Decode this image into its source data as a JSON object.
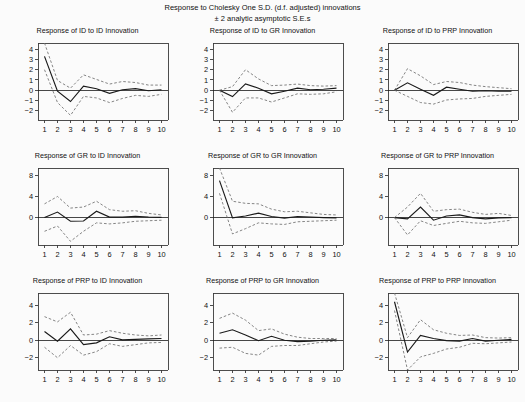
{
  "figure": {
    "title": "Response to Cholesky One S.D. (d.f. adjusted) innovations\n± 2 analytic asymptotic S.E.s",
    "title_line1": "Response to Cholesky One S.D. (d.f. adjusted) innovations",
    "title_line2": "± 2 analytic asymptotic S.E.s",
    "background_color": "#fbfbfb",
    "line_color": "#1a1a1a",
    "band_color": "#6f6f6f",
    "axis_color": "#3a3a3a",
    "rows": 3,
    "columns": 3
  },
  "chart_data": [
    {
      "type": "line",
      "title": "Response of ID to ID Innovation",
      "xlabel": "",
      "ylabel": "",
      "x": [
        1,
        2,
        3,
        4,
        5,
        6,
        7,
        8,
        9,
        10
      ],
      "xlim": [
        0.5,
        10.5
      ],
      "ylim": [
        -2.9,
        4.6
      ],
      "yticks": [
        -2,
        -1,
        0,
        1,
        2,
        3,
        4
      ],
      "xticks": [
        1,
        2,
        3,
        4,
        5,
        6,
        7,
        8,
        9,
        10
      ],
      "grid": false,
      "legend": "none",
      "zero_line": true,
      "series": [
        {
          "name": "response",
          "style": "solid",
          "values": [
            3.3,
            -0.1,
            -1.1,
            0.4,
            0.15,
            -0.3,
            0.05,
            0.15,
            -0.05,
            0.05
          ]
        },
        {
          "name": "upper_2se",
          "style": "dashed",
          "values": [
            4.6,
            0.95,
            0.2,
            1.5,
            1.05,
            0.6,
            0.85,
            0.75,
            0.5,
            0.5
          ]
        },
        {
          "name": "lower_2se",
          "style": "dashed",
          "values": [
            2.0,
            -1.2,
            -2.45,
            -0.6,
            -0.75,
            -1.2,
            -0.8,
            -0.5,
            -0.6,
            -0.4
          ]
        }
      ]
    },
    {
      "type": "line",
      "title": "Response of ID to GR Innovation",
      "xlabel": "",
      "ylabel": "",
      "x": [
        1,
        2,
        3,
        4,
        5,
        6,
        7,
        8,
        9,
        10
      ],
      "xlim": [
        0.5,
        10.5
      ],
      "ylim": [
        -2.9,
        4.6
      ],
      "yticks": [
        -2,
        -1,
        0,
        1,
        2,
        3,
        4
      ],
      "xticks": [
        1,
        2,
        3,
        4,
        5,
        6,
        7,
        8,
        9,
        10
      ],
      "grid": false,
      "legend": "none",
      "zero_line": true,
      "series": [
        {
          "name": "response",
          "style": "solid",
          "values": [
            0.0,
            -0.62,
            0.62,
            0.2,
            -0.35,
            -0.1,
            0.2,
            0.05,
            0.1,
            0.2
          ]
        },
        {
          "name": "upper_2se",
          "style": "dashed",
          "values": [
            0.0,
            0.35,
            2.0,
            1.1,
            0.45,
            0.5,
            0.6,
            0.45,
            0.4,
            0.45
          ]
        },
        {
          "name": "lower_2se",
          "style": "dashed",
          "values": [
            0.0,
            -2.15,
            -0.75,
            -0.75,
            -1.15,
            -0.75,
            -0.35,
            -0.4,
            -0.35,
            -0.15
          ]
        }
      ]
    },
    {
      "type": "line",
      "title": "Response of ID to PRP Innovation",
      "xlabel": "",
      "ylabel": "",
      "x": [
        1,
        2,
        3,
        4,
        5,
        6,
        7,
        8,
        9,
        10
      ],
      "xlim": [
        0.5,
        10.5
      ],
      "ylim": [
        -2.9,
        4.6
      ],
      "yticks": [
        -2,
        -1,
        0,
        1,
        2,
        3,
        4
      ],
      "xticks": [
        1,
        2,
        3,
        4,
        5,
        6,
        7,
        8,
        9,
        10
      ],
      "grid": false,
      "legend": "none",
      "zero_line": true,
      "series": [
        {
          "name": "response",
          "style": "solid",
          "values": [
            0.0,
            0.72,
            0.1,
            -0.5,
            0.3,
            0.1,
            -0.1,
            -0.05,
            -0.1,
            -0.1
          ]
        },
        {
          "name": "upper_2se",
          "style": "dashed",
          "values": [
            0.0,
            2.1,
            1.4,
            0.55,
            0.85,
            0.75,
            0.5,
            0.35,
            0.25,
            0.15
          ]
        },
        {
          "name": "lower_2se",
          "style": "dashed",
          "values": [
            0.0,
            -0.6,
            -1.2,
            -1.35,
            -0.95,
            -0.85,
            -0.8,
            -0.6,
            -0.5,
            -0.4
          ]
        }
      ]
    },
    {
      "type": "line",
      "title": "Response of GR to ID Innovation",
      "xlabel": "",
      "ylabel": "",
      "x": [
        1,
        2,
        3,
        4,
        5,
        6,
        7,
        8,
        9,
        10
      ],
      "xlim": [
        0.5,
        10.5
      ],
      "ylim": [
        -5.2,
        9.4
      ],
      "yticks": [
        0,
        4,
        8
      ],
      "xticks": [
        1,
        2,
        3,
        4,
        5,
        6,
        7,
        8,
        9,
        10
      ],
      "grid": false,
      "legend": "none",
      "zero_line": true,
      "series": [
        {
          "name": "response",
          "style": "solid",
          "values": [
            0.0,
            1.05,
            -0.7,
            -0.65,
            1.2,
            0.1,
            0.1,
            0.25,
            0.1,
            0.05
          ]
        },
        {
          "name": "upper_2se",
          "style": "dashed",
          "values": [
            2.6,
            4.0,
            1.8,
            2.0,
            3.1,
            1.5,
            1.2,
            1.3,
            0.8,
            0.5
          ]
        },
        {
          "name": "lower_2se",
          "style": "dashed",
          "values": [
            -2.6,
            -1.6,
            -4.5,
            -2.6,
            -1.0,
            -1.2,
            -1.0,
            -0.7,
            -0.6,
            -0.5
          ]
        }
      ]
    },
    {
      "type": "line",
      "title": "Response of GR to GR Innovation",
      "xlabel": "",
      "ylabel": "",
      "x": [
        1,
        2,
        3,
        4,
        5,
        6,
        7,
        8,
        9,
        10
      ],
      "xlim": [
        0.5,
        10.5
      ],
      "ylim": [
        -5.2,
        9.4
      ],
      "yticks": [
        0,
        4,
        8
      ],
      "xticks": [
        1,
        2,
        3,
        4,
        5,
        6,
        7,
        8,
        9,
        10
      ],
      "grid": false,
      "legend": "none",
      "zero_line": true,
      "series": [
        {
          "name": "response",
          "style": "solid",
          "values": [
            7.0,
            -0.05,
            0.3,
            0.85,
            0.2,
            -0.1,
            0.2,
            0.1,
            0.0,
            -0.05
          ]
        },
        {
          "name": "upper_2se",
          "style": "dashed",
          "values": [
            9.4,
            3.1,
            2.7,
            2.6,
            1.6,
            1.1,
            1.2,
            0.9,
            0.6,
            0.5
          ]
        },
        {
          "name": "lower_2se",
          "style": "dashed",
          "values": [
            4.6,
            -3.1,
            -2.1,
            -1.0,
            -1.2,
            -1.3,
            -0.8,
            -0.7,
            -0.6,
            -0.5
          ]
        }
      ]
    },
    {
      "type": "line",
      "title": "Response of GR to PRP Innovation",
      "xlabel": "",
      "ylabel": "",
      "x": [
        1,
        2,
        3,
        4,
        5,
        6,
        7,
        8,
        9,
        10
      ],
      "xlim": [
        0.5,
        10.5
      ],
      "ylim": [
        -5.2,
        9.4
      ],
      "yticks": [
        0,
        4,
        8
      ],
      "xticks": [
        1,
        2,
        3,
        4,
        5,
        6,
        7,
        8,
        9,
        10
      ],
      "grid": false,
      "legend": "none",
      "zero_line": true,
      "series": [
        {
          "name": "response",
          "style": "solid",
          "values": [
            0.0,
            -0.25,
            2.0,
            -0.5,
            0.3,
            0.5,
            0.0,
            -0.25,
            -0.05,
            0.0
          ]
        },
        {
          "name": "upper_2se",
          "style": "dashed",
          "values": [
            0.0,
            2.0,
            4.6,
            1.2,
            1.5,
            1.6,
            1.0,
            0.6,
            0.8,
            0.4
          ]
        },
        {
          "name": "lower_2se",
          "style": "dashed",
          "values": [
            0.0,
            -3.3,
            -0.6,
            -1.5,
            -1.1,
            -0.7,
            -1.0,
            -1.1,
            -0.8,
            -0.5
          ]
        }
      ]
    },
    {
      "type": "line",
      "title": "Response of PRP to ID Innovation",
      "xlabel": "",
      "ylabel": "",
      "x": [
        1,
        2,
        3,
        4,
        5,
        6,
        7,
        8,
        9,
        10
      ],
      "xlim": [
        0.5,
        10.5
      ],
      "ylim": [
        -3.4,
        5.4
      ],
      "yticks": [
        -2,
        0,
        2,
        4
      ],
      "xticks": [
        1,
        2,
        3,
        4,
        5,
        6,
        7,
        8,
        9,
        10
      ],
      "grid": false,
      "legend": "none",
      "zero_line": true,
      "series": [
        {
          "name": "response",
          "style": "solid",
          "values": [
            1.0,
            -0.1,
            1.3,
            -0.5,
            -0.3,
            0.4,
            0.05,
            0.1,
            0.15,
            0.2
          ]
        },
        {
          "name": "upper_2se",
          "style": "dashed",
          "values": [
            2.7,
            2.1,
            3.2,
            0.6,
            0.7,
            1.1,
            0.8,
            0.6,
            0.5,
            0.6
          ]
        },
        {
          "name": "lower_2se",
          "style": "dashed",
          "values": [
            -0.8,
            -2.0,
            -0.6,
            -1.7,
            -1.3,
            -0.4,
            -0.7,
            -0.5,
            -0.3,
            -0.25
          ]
        }
      ]
    },
    {
      "type": "line",
      "title": "Response of PRP to GR Innovation",
      "xlabel": "",
      "ylabel": "",
      "x": [
        1,
        2,
        3,
        4,
        5,
        6,
        7,
        8,
        9,
        10
      ],
      "xlim": [
        0.5,
        10.5
      ],
      "ylim": [
        -3.4,
        5.4
      ],
      "yticks": [
        -2,
        0,
        2,
        4
      ],
      "xticks": [
        1,
        2,
        3,
        4,
        5,
        6,
        7,
        8,
        9,
        10
      ],
      "grid": false,
      "legend": "none",
      "zero_line": true,
      "series": [
        {
          "name": "response",
          "style": "solid",
          "values": [
            0.8,
            1.2,
            0.6,
            -0.05,
            0.45,
            0.0,
            -0.15,
            -0.1,
            0.0,
            0.05
          ]
        },
        {
          "name": "upper_2se",
          "style": "dashed",
          "values": [
            2.5,
            3.1,
            2.3,
            1.1,
            1.3,
            0.7,
            0.35,
            0.2,
            0.2,
            0.2
          ]
        },
        {
          "name": "lower_2se",
          "style": "dashed",
          "values": [
            -0.9,
            -0.8,
            -1.5,
            -1.7,
            -0.7,
            -0.6,
            -0.6,
            -0.4,
            -0.2,
            -0.1
          ]
        }
      ]
    },
    {
      "type": "line",
      "title": "Response of PRP to PRP Innovation",
      "xlabel": "",
      "ylabel": "",
      "x": [
        1,
        2,
        3,
        4,
        5,
        6,
        7,
        8,
        9,
        10
      ],
      "xlim": [
        0.5,
        10.5
      ],
      "ylim": [
        -3.4,
        5.4
      ],
      "yticks": [
        -2,
        0,
        2,
        4
      ],
      "xticks": [
        1,
        2,
        3,
        4,
        5,
        6,
        7,
        8,
        9,
        10
      ],
      "grid": false,
      "legend": "none",
      "zero_line": true,
      "series": [
        {
          "name": "response",
          "style": "solid",
          "values": [
            4.4,
            -1.35,
            0.55,
            0.2,
            -0.05,
            -0.1,
            0.2,
            -0.1,
            0.0,
            0.1
          ]
        },
        {
          "name": "upper_2se",
          "style": "dashed",
          "values": [
            5.4,
            0.3,
            2.35,
            1.2,
            0.8,
            0.55,
            0.6,
            0.3,
            0.25,
            0.3
          ]
        },
        {
          "name": "lower_2se",
          "style": "dashed",
          "values": [
            3.4,
            -3.4,
            -1.9,
            -1.5,
            -1.0,
            -0.8,
            -0.35,
            -0.4,
            -0.3,
            -0.2
          ]
        }
      ]
    }
  ]
}
